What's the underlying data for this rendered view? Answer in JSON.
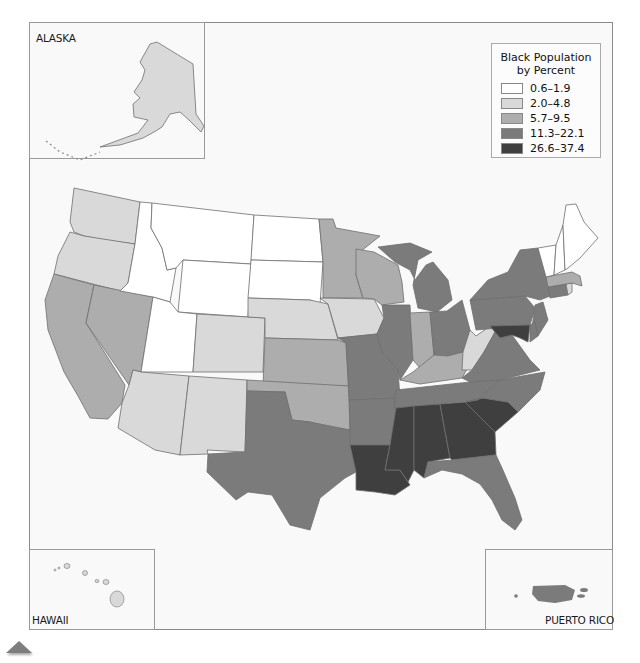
{
  "map": {
    "legend": {
      "title_line1": "Black Population",
      "title_line2": "by Percent",
      "classes": [
        {
          "label": "0.6–1.9",
          "color": "#ffffff"
        },
        {
          "label": "2.0–4.8",
          "color": "#d9d9d9"
        },
        {
          "label": "5.7–9.5",
          "color": "#adadad"
        },
        {
          "label": "11.3–22.1",
          "color": "#7b7b7b"
        },
        {
          "label": "26.6–37.4",
          "color": "#3f3f3f"
        }
      ]
    },
    "insets": {
      "alaska": "ALASKA",
      "hawaii": "HAWAII",
      "puerto_rico": "PUERTO RICO"
    },
    "state_classes": {
      "WA": "2.0–4.8",
      "OR": "2.0–4.8",
      "CA": "5.7–9.5",
      "NV": "5.7–9.5",
      "ID": "0.6–1.9",
      "MT": "0.6–1.9",
      "WY": "0.6–1.9",
      "UT": "0.6–1.9",
      "AZ": "2.0–4.8",
      "NM": "2.0–4.8",
      "CO": "2.0–4.8",
      "ND": "0.6–1.9",
      "SD": "0.6–1.9",
      "NE": "2.0–4.8",
      "KS": "5.7–9.5",
      "OK": "5.7–9.5",
      "TX": "11.3–22.1",
      "MN": "5.7–9.5",
      "IA": "2.0–4.8",
      "MO": "11.3–22.1",
      "AR": "11.3–22.1",
      "LA": "26.6–37.4",
      "WI": "5.7–9.5",
      "IL": "11.3–22.1",
      "MI": "11.3–22.1",
      "IN": "5.7–9.5",
      "OH": "11.3–22.1",
      "KY": "5.7–9.5",
      "TN": "11.3–22.1",
      "MS": "26.6–37.4",
      "AL": "26.6–37.4",
      "GA": "26.6–37.4",
      "FL": "11.3–22.1",
      "SC": "26.6–37.4",
      "NC": "11.3–22.1",
      "VA": "11.3–22.1",
      "WV": "2.0–4.8",
      "PA": "11.3–22.1",
      "NY": "11.3–22.1",
      "NJ": "11.3–22.1",
      "DE": "11.3–22.1",
      "MD": "26.6–37.4",
      "CT": "5.7–9.5",
      "RI": "2.0–4.8",
      "MA": "5.7–9.5",
      "VT": "0.6–1.9",
      "NH": "0.6–1.9",
      "ME": "0.6–1.9",
      "AK": "2.0–4.8",
      "HI": "2.0–4.8",
      "PR": "11.3–22.1"
    }
  },
  "nav": {
    "back_icon": "triangle-up-icon"
  }
}
